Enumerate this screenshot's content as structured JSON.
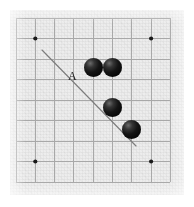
{
  "figure": {
    "kind": "go-board-diagram",
    "width": 194,
    "height": 207,
    "background_color": "#ffffff"
  },
  "board": {
    "label": "Go board",
    "columns": 9,
    "rows": 9,
    "board_color": "#ededed",
    "grid_color": "#a8a8a8",
    "left": 10,
    "top": 10,
    "width": 174,
    "height": 185,
    "cell_width": 19.3,
    "cell_height": 20.5,
    "origin_x": 6,
    "origin_y": 8
  },
  "star_points": {
    "label": "Star points (hoshi)",
    "color": "#1a1a1a",
    "radius": 2.1,
    "points": [
      {
        "name": "star-point-top-left",
        "col": 1,
        "row": 1,
        "x": 25.3,
        "y": 28.5
      },
      {
        "name": "star-point-top-right",
        "col": 7,
        "row": 1,
        "x": 141.1,
        "y": 28.5
      },
      {
        "name": "star-point-bottom-left",
        "col": 1,
        "row": 7,
        "x": 25.3,
        "y": 151.5
      },
      {
        "name": "star-point-bottom-right",
        "col": 7,
        "row": 7,
        "x": 141.1,
        "y": 151.5
      }
    ]
  },
  "stones": {
    "label": "Black stones",
    "color": "#0b0b0b",
    "diameter": 19,
    "items": [
      {
        "name": "stone-1",
        "color": "black",
        "col": 4,
        "row": 2,
        "cx": 83.5,
        "cy": 57.0
      },
      {
        "name": "stone-2",
        "color": "black",
        "col": 5,
        "row": 2,
        "cx": 102.5,
        "cy": 57.0
      },
      {
        "name": "stone-3",
        "color": "black",
        "col": 5,
        "row": 4,
        "cx": 102.5,
        "cy": 97.5
      },
      {
        "name": "stone-4",
        "color": "black",
        "col": 6,
        "row": 5,
        "cx": 121.5,
        "cy": 119.0
      }
    ]
  },
  "direction_line": {
    "name": "diagonal-direction-line",
    "label": "Diagonal line A",
    "color": "#7d7d7d",
    "x1": 32,
    "y1": 40,
    "x2": 126,
    "y2": 136
  },
  "annotations": {
    "label_a": {
      "name": "label-a",
      "text": "A",
      "x": 58,
      "y": 60,
      "color": "#1d1d1d",
      "font_size": 12
    }
  }
}
